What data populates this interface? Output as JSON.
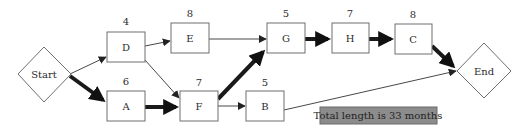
{
  "diagram": {
    "type": "activity-network",
    "start": {
      "label": "Start"
    },
    "end": {
      "label": "End"
    },
    "nodes": [
      {
        "id": "D",
        "label": "D",
        "duration": "4"
      },
      {
        "id": "E",
        "label": "E",
        "duration": "8"
      },
      {
        "id": "A",
        "label": "A",
        "duration": "6"
      },
      {
        "id": "F",
        "label": "F",
        "duration": "7"
      },
      {
        "id": "G",
        "label": "G",
        "duration": "5"
      },
      {
        "id": "B",
        "label": "B",
        "duration": "5"
      },
      {
        "id": "H",
        "label": "H",
        "duration": "7"
      },
      {
        "id": "C",
        "label": "C",
        "duration": "8"
      }
    ],
    "edges": [
      {
        "from": "Start",
        "to": "D",
        "critical": false
      },
      {
        "from": "Start",
        "to": "A",
        "critical": true
      },
      {
        "from": "D",
        "to": "E",
        "critical": false
      },
      {
        "from": "D",
        "to": "F",
        "critical": false
      },
      {
        "from": "A",
        "to": "F",
        "critical": true
      },
      {
        "from": "E",
        "to": "G",
        "critical": false
      },
      {
        "from": "F",
        "to": "G",
        "critical": true
      },
      {
        "from": "F",
        "to": "B",
        "critical": false
      },
      {
        "from": "G",
        "to": "H",
        "critical": true
      },
      {
        "from": "H",
        "to": "C",
        "critical": true
      },
      {
        "from": "C",
        "to": "End",
        "critical": true
      },
      {
        "from": "B",
        "to": "End",
        "critical": false
      }
    ],
    "total_label": "Total length is 33 months",
    "colors": {
      "critical_arrow": "#1a1a1a",
      "normal_arrow": "#333333",
      "total_box": "#8c8c8c"
    }
  }
}
